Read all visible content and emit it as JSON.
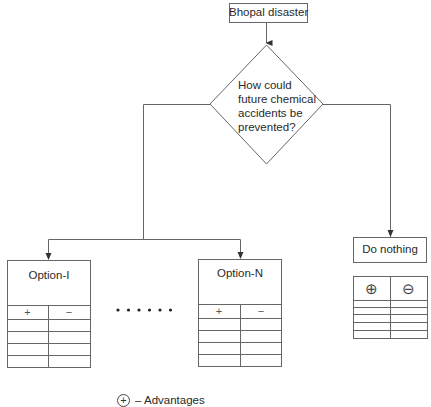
{
  "diagram": {
    "root": {
      "label": "Bhopal disaster"
    },
    "decision": {
      "label": "How could future chemical accidents be prevented?"
    },
    "options": [
      {
        "label": "Option-I",
        "columns": [
          "+",
          "−"
        ],
        "empty_rows": 4
      },
      {
        "label": "Option-N",
        "columns": [
          "+",
          "−"
        ],
        "empty_rows": 4
      },
      {
        "label": "Do nothing",
        "columns": [
          "⊕",
          "⊖"
        ],
        "empty_rows": 4
      }
    ],
    "ellipsis": "• • • • • •",
    "legend": [
      {
        "symbol": "+",
        "text": "– Advantages"
      }
    ],
    "colors": {
      "line": "#555555",
      "text": "#2a2a2a",
      "background": "#ffffff"
    }
  }
}
